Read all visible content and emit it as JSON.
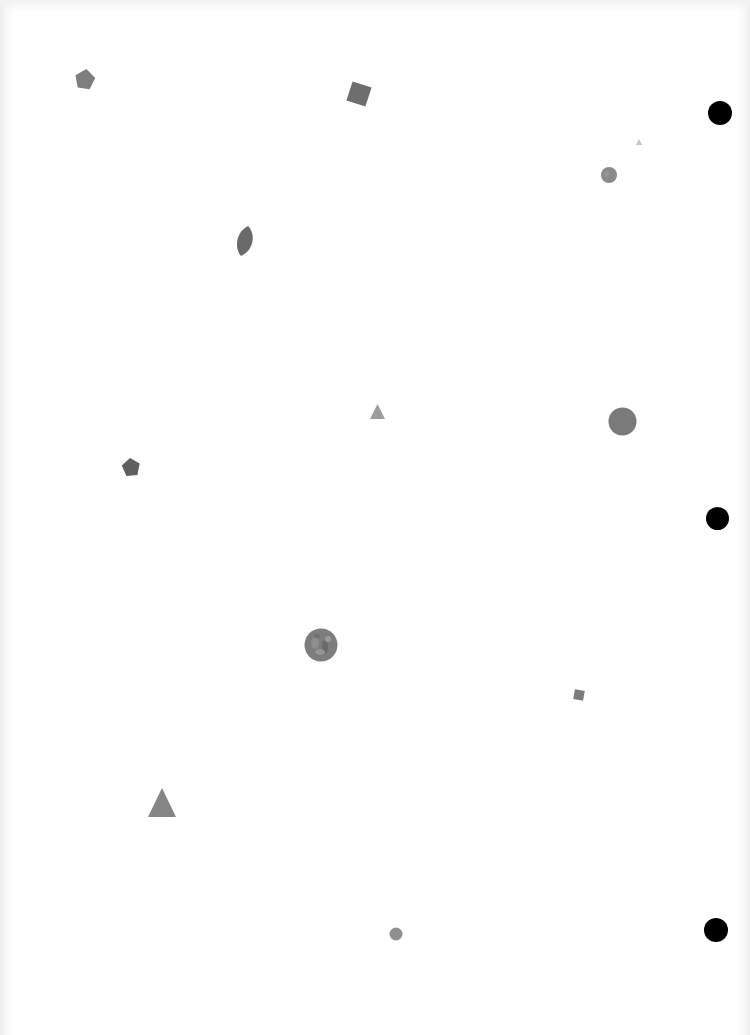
{
  "page": {
    "background": "#ffffff"
  },
  "shapes": [
    {
      "id": "pentagon-1",
      "type": "pentagon",
      "x": 74,
      "y": 68,
      "size": 22,
      "rotate": 8,
      "color": "#7e7e7e"
    },
    {
      "id": "square-1",
      "type": "square",
      "x": 347,
      "y": 82,
      "size": 22,
      "rotate": 18,
      "color": "#6e6e6e"
    },
    {
      "id": "circle-small-1",
      "type": "circle",
      "x": 601,
      "y": 167,
      "size": 16,
      "color": "#8a8a8a"
    },
    {
      "id": "leaf-1",
      "type": "leaf",
      "x": 235,
      "y": 226,
      "size": 20,
      "rotate": 20,
      "color": "#6a6a6a"
    },
    {
      "id": "triangle-small-1",
      "type": "triangle",
      "x": 370,
      "y": 404,
      "size": 14,
      "color": "#9d9d9d"
    },
    {
      "id": "circle-large-1",
      "type": "circle",
      "x": 608,
      "y": 407,
      "size": 28,
      "color": "#7a7a7a"
    },
    {
      "id": "pentagon-2",
      "type": "pentagon",
      "x": 121,
      "y": 457,
      "size": 19,
      "rotate": -6,
      "color": "#5f5f5f"
    },
    {
      "id": "circle-textured-1",
      "type": "circle",
      "x": 304,
      "y": 628,
      "size": 33,
      "color": "#7d7d7d"
    },
    {
      "id": "square-small-1",
      "type": "square",
      "x": 573,
      "y": 689,
      "size": 11,
      "rotate": 10,
      "color": "#7b7b7b"
    },
    {
      "id": "triangle-1",
      "type": "triangle",
      "x": 148,
      "y": 788,
      "size": 28,
      "color": "#858585"
    },
    {
      "id": "circle-small-2",
      "type": "circle",
      "x": 389,
      "y": 927,
      "size": 13,
      "color": "#8f8f8f"
    }
  ],
  "punch_holes": [
    {
      "id": "hole-top",
      "x": 708,
      "y": 101,
      "size": 24
    },
    {
      "id": "hole-middle",
      "x": 706,
      "y": 507,
      "size": 23
    },
    {
      "id": "hole-bottom",
      "x": 704,
      "y": 918,
      "size": 24
    }
  ]
}
